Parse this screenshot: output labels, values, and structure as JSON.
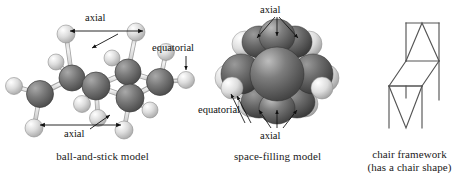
{
  "figure": {
    "background_color": "#ffffff",
    "line_color": "#555555",
    "text_color": "#1a1a1a",
    "carbon_color": "#6e6e6e",
    "hydrogen_color": "#d8d8d8",
    "bond_color": "#cfcfcf"
  },
  "panels": {
    "ball_and_stick": {
      "caption": "ball-and-stick model",
      "labels": {
        "axial_top": "axial",
        "equatorial_right": "equatorial",
        "axial_bottom": "axial"
      }
    },
    "space_filling": {
      "caption": "space-filling model",
      "labels": {
        "axial_top": "axial",
        "equatorial_left": "equatorial",
        "axial_bottom": "axial"
      }
    },
    "chair_framework": {
      "caption_line1": "chair framework",
      "caption_line2": "(has a chair shape)"
    }
  }
}
